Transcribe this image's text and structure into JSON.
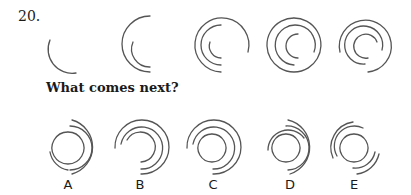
{
  "question": {
    "number": "20.",
    "prompt": "What comes next?"
  },
  "sequence": [
    {
      "id": "seq-1",
      "arcs": 1
    },
    {
      "id": "seq-2",
      "arcs": 2
    },
    {
      "id": "seq-3",
      "arcs": 3
    },
    {
      "id": "seq-4",
      "arcs": 3
    },
    {
      "id": "seq-5",
      "arcs": 3
    }
  ],
  "options": [
    {
      "label": "A"
    },
    {
      "label": "B"
    },
    {
      "label": "C"
    },
    {
      "label": "D"
    },
    {
      "label": "E"
    }
  ],
  "colors": {
    "stroke": "#555555",
    "text": "#1a1a1a",
    "background": "#ffffff"
  }
}
